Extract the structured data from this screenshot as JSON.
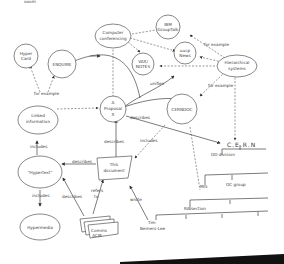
{
  "header": {
    "cut_off_text": "ooom"
  },
  "nodes": {
    "hypercard": {
      "line1": "Hyper",
      "line2": "Card"
    },
    "enquire": {
      "label": "ENQUIRE"
    },
    "computer_conferencing": {
      "line1": "Computer",
      "line2": "conferencing"
    },
    "ibm_grouptalk": {
      "line1": "IBM",
      "line2": "GroupTalk"
    },
    "uucp_news": {
      "line1": "uucp",
      "line2": "News"
    },
    "vax_notes": {
      "line1": "VAX/",
      "line2": "NOTES"
    },
    "hierarchical_systems": {
      "line1": "Hierarchical",
      "line2": "systems"
    },
    "proposal": {
      "line1": "A",
      "line2": "Proposal",
      "line3": "X"
    },
    "cerndoc": {
      "label": "CERNDOC"
    },
    "linked_information": {
      "line1": "Linked",
      "line2": "information"
    },
    "hypertext": {
      "label": "\"Hypertext\""
    },
    "this_document": {
      "line1": "This",
      "line2": "document"
    },
    "hypermedia": {
      "label": "Hypermedia"
    },
    "comms_acm": {
      "line1": "Comms",
      "line2": "ACM"
    },
    "cern": {
      "label": "C.E.R.N"
    },
    "dd_division": {
      "label": "DD division"
    },
    "mis": {
      "label": "MIS"
    },
    "oc_group": {
      "label": "OC group"
    },
    "ra_section": {
      "label": "RA section"
    },
    "tim": {
      "line1": "Tim",
      "line2": "Berners-Lee"
    }
  },
  "edges": {
    "for_example_1": "for example",
    "for_example_2": "for example",
    "for_example_3": "for example",
    "unifies": "unifies",
    "describes_1": "describes",
    "describes_2": "describes",
    "describes_3": "describes",
    "describes_4": "describes",
    "includes_1": "includes",
    "includes_2": "includes",
    "includes_3": "includes",
    "refers_to_1": "refers",
    "refers_to_2": "to",
    "wrote": "wrote"
  }
}
